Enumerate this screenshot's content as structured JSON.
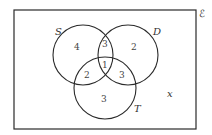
{
  "diagram": {
    "type": "venn",
    "universal_symbol": "ℰ",
    "sets": [
      {
        "name": "S",
        "label_pos": [
          57,
          33
        ]
      },
      {
        "name": "D",
        "label_pos": [
          154,
          33
        ]
      },
      {
        "name": "T",
        "label_pos": [
          136,
          110
        ]
      }
    ],
    "regions": {
      "S_only": "4",
      "S_and_D_only": "3",
      "D_only": "2",
      "S_and_T_only": "2",
      "S_D_T": "1",
      "D_and_T_only": "3",
      "T_only": "3",
      "outside": "x"
    },
    "stroke_color": "#2a2a2a"
  }
}
